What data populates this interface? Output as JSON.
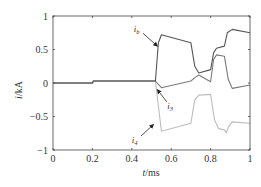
{
  "chart_data": {
    "type": "line",
    "title": "",
    "xlabel": "t/ms",
    "ylabel": "i/kA",
    "xlim": [
      0,
      1
    ],
    "ylim": [
      -1,
      1
    ],
    "xticks": [
      0,
      0.2,
      0.4,
      0.6,
      0.8,
      1
    ],
    "xtick_labels": [
      "0",
      "0.2",
      "0.4",
      "0.6",
      "0.8",
      "1"
    ],
    "yticks": [
      1,
      0.5,
      0,
      -0.5,
      -1
    ],
    "ytick_labels": [
      "1",
      "0.5",
      "0",
      "−0.5",
      "−1"
    ],
    "grid": false,
    "legend": "annotations with arrows",
    "series": [
      {
        "name": "i_b",
        "color": "#555555",
        "x": [
          0,
          0.2,
          0.205,
          0.52,
          0.535,
          0.55,
          0.7,
          0.72,
          0.74,
          0.8,
          0.815,
          0.83,
          0.87,
          0.885,
          0.91,
          1.0
        ],
        "y": [
          0,
          0,
          0.03,
          0.03,
          0.6,
          0.72,
          0.6,
          0.25,
          0.15,
          0.2,
          0.45,
          0.52,
          0.55,
          0.75,
          0.8,
          0.75
        ]
      },
      {
        "name": "i_3",
        "color": "#7a7a7a",
        "x": [
          0,
          0.2,
          0.205,
          0.52,
          0.55,
          0.7,
          0.72,
          0.74,
          0.8,
          0.815,
          0.83,
          0.87,
          0.89,
          0.91,
          1.0
        ],
        "y": [
          0,
          0,
          0.03,
          0.03,
          -0.07,
          0.03,
          0.08,
          0.12,
          0.02,
          0.35,
          0.42,
          0.4,
          0.05,
          -0.08,
          -0.03
        ]
      },
      {
        "name": "i_4",
        "color": "#bdbdbd",
        "x": [
          0,
          0.2,
          0.205,
          0.52,
          0.55,
          0.7,
          0.72,
          0.74,
          0.8,
          0.82,
          0.84,
          0.87,
          0.88,
          0.89,
          0.91,
          1.0
        ],
        "y": [
          0,
          0,
          0.03,
          0.03,
          -0.72,
          -0.6,
          -0.25,
          -0.18,
          -0.17,
          -0.55,
          -0.68,
          -0.7,
          -0.74,
          -0.66,
          -0.58,
          -0.6
        ]
      }
    ],
    "annotations": [
      {
        "text": "i_b",
        "x": 0.43,
        "y": 0.8,
        "arrow_to": [
          0.53,
          0.55
        ]
      },
      {
        "text": "i_3",
        "x": 0.6,
        "y": -0.35,
        "arrow_to": [
          0.53,
          -0.1
        ]
      },
      {
        "text": "i_4",
        "x": 0.42,
        "y": -0.85,
        "arrow_to": [
          0.51,
          -0.62
        ]
      }
    ]
  },
  "labels": {
    "ylabel_main": "i",
    "ylabel_unit": "/kA",
    "xlabel_main": "t",
    "xlabel_unit": "/ms",
    "ib_main": "i",
    "ib_sub": "b",
    "i3_main": "i",
    "i3_sub": "3",
    "i4_main": "i",
    "i4_sub": "4"
  }
}
